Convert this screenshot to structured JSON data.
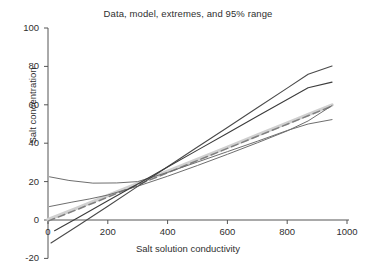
{
  "chart_data": {
    "type": "line",
    "title": "Data, model, extremes, and 95% range",
    "xlabel": "Salt solution conductivity",
    "ylabel": "Salt concentration",
    "xlim": [
      0,
      1000
    ],
    "ylim": [
      -20,
      100
    ],
    "xticks": [
      0,
      200,
      400,
      600,
      800,
      1000
    ],
    "yticks": [
      -20,
      0,
      20,
      40,
      60,
      80,
      100
    ],
    "xtick_labels": [
      "0",
      "200",
      "400",
      "600",
      "800",
      "1000"
    ],
    "ytick_labels": [
      "-20",
      "0",
      "20",
      "40",
      "60",
      "80",
      "100"
    ],
    "grid": false,
    "legend": "none",
    "series": [
      {
        "name": "model",
        "role": "fitted-model",
        "color": "#d0d0d0",
        "width": 3.4,
        "style": "solid",
        "x": [
          0,
          100,
          200,
          300,
          400,
          500,
          600,
          700,
          800,
          870,
          950
        ],
        "y": [
          0.2,
          6.4,
          12.7,
          19.0,
          25.3,
          31.6,
          37.9,
          44.2,
          50.5,
          54.9,
          59.9
        ]
      },
      {
        "name": "data",
        "role": "observed-data",
        "color": "#7f7f7f",
        "width": 1.5,
        "style": "dashed",
        "x": [
          0,
          100,
          200,
          300,
          400,
          500,
          600,
          700,
          800,
          870,
          950
        ],
        "y": [
          -0.6,
          5.6,
          11.9,
          18.3,
          24.6,
          31.0,
          37.3,
          43.6,
          49.9,
          54.3,
          59.3
        ]
      },
      {
        "name": "upper extreme",
        "role": "extreme-high",
        "color": "#4a4a4a",
        "width": 1.1,
        "style": "solid",
        "x": [
          10,
          100,
          200,
          300,
          400,
          500,
          600,
          700,
          800,
          870,
          950
        ],
        "y": [
          -12.0,
          -3.0,
          7.2,
          17.5,
          27.7,
          38.0,
          48.2,
          58.5,
          68.7,
          75.9,
          80.2
        ]
      },
      {
        "name": "lower extreme",
        "role": "extreme-low",
        "color": "#3c3c3c",
        "width": 1.1,
        "style": "solid",
        "x": [
          22,
          100,
          200,
          300,
          400,
          500,
          600,
          700,
          800,
          870,
          950
        ],
        "y": [
          -5.6,
          1.2,
          10.0,
          18.8,
          27.6,
          36.4,
          45.2,
          54.0,
          62.8,
          68.9,
          71.8
        ]
      },
      {
        "name": "95% upper bound",
        "role": "ci-upper",
        "color": "#6e6e6e",
        "width": 1.0,
        "style": "solid",
        "x": [
          5,
          70,
          150,
          230,
          300,
          400,
          500,
          600,
          700,
          800,
          870,
          950
        ],
        "y": [
          22.5,
          20.6,
          19.2,
          19.3,
          20.0,
          24.8,
          30.2,
          35.6,
          41.0,
          46.6,
          50.0,
          52.3
        ]
      },
      {
        "name": "95% lower bound",
        "role": "ci-lower",
        "color": "#6e6e6e",
        "width": 1.0,
        "style": "solid",
        "x": [
          5,
          80,
          140,
          200,
          300,
          400,
          500,
          600,
          700,
          800,
          870,
          950
        ],
        "y": [
          7.0,
          9.3,
          11.0,
          13.0,
          17.6,
          22.8,
          28.4,
          34.2,
          40.2,
          46.4,
          51.6,
          59.6
        ]
      }
    ]
  },
  "axis": {
    "x_label": "Salt solution conductivity",
    "y_label": "Salt concentration"
  },
  "title": "Data, model, extremes, and 95% range"
}
